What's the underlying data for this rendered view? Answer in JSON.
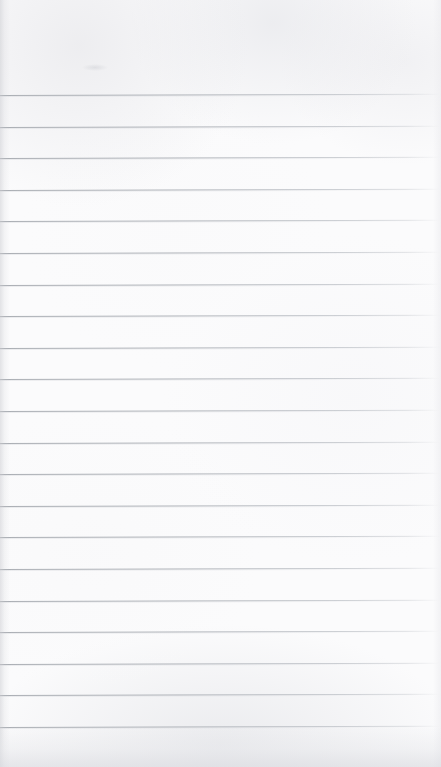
{
  "page": {
    "kind": "scanned-blank-ruled-notepad-page",
    "width": 767,
    "height": 767,
    "paper_color": "#fbfbfc",
    "rule_color": "#b5b9be",
    "rule_count": 21,
    "first_rule_y": 95,
    "last_rule_y": 727,
    "rule_spacing": 31.6,
    "rule_thickness": 1,
    "rule_tilt_degrees": -0.15,
    "top_margin_height": 95,
    "bottom_margin_height": 40,
    "has_vertical_margin_rule": false,
    "text_content": "",
    "handwriting": "",
    "header_text": "",
    "footer_text": ""
  },
  "rules": [
    {
      "index": 1,
      "y": 95
    },
    {
      "index": 2,
      "y": 126.6
    },
    {
      "index": 3,
      "y": 158.2
    },
    {
      "index": 4,
      "y": 189.8
    },
    {
      "index": 5,
      "y": 221.4
    },
    {
      "index": 6,
      "y": 253
    },
    {
      "index": 7,
      "y": 284.6
    },
    {
      "index": 8,
      "y": 316.2
    },
    {
      "index": 9,
      "y": 347.8
    },
    {
      "index": 10,
      "y": 379.4
    },
    {
      "index": 11,
      "y": 411
    },
    {
      "index": 12,
      "y": 442.6
    },
    {
      "index": 13,
      "y": 474.2
    },
    {
      "index": 14,
      "y": 505.8
    },
    {
      "index": 15,
      "y": 537.4
    },
    {
      "index": 16,
      "y": 569
    },
    {
      "index": 17,
      "y": 600.6
    },
    {
      "index": 18,
      "y": 632.2
    },
    {
      "index": 19,
      "y": 663.8
    },
    {
      "index": 20,
      "y": 695.4
    },
    {
      "index": 21,
      "y": 727
    }
  ],
  "marks": [
    {
      "name": "faint-smudge",
      "x": 82,
      "y": 64,
      "width": 26,
      "height": 7
    }
  ]
}
